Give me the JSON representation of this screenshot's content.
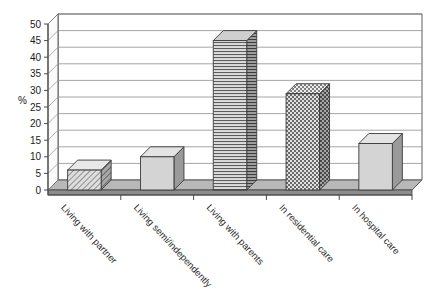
{
  "chart_data": {
    "type": "bar",
    "title": "",
    "subtitle": "",
    "xlabel": "",
    "ylabel": "%",
    "ylim": [
      0,
      50
    ],
    "ytick_step": 5,
    "yticks": [
      "0",
      "5",
      "10",
      "15",
      "20",
      "25",
      "30",
      "35",
      "40",
      "45",
      "50"
    ],
    "grid": true,
    "grid_axis": "y",
    "legend": false,
    "legend_position": "none",
    "style": "3d-column",
    "categories": [
      "Living with partner",
      "Living semi/independently",
      "Living with parents",
      "In residential care",
      "In hospital care"
    ],
    "values": [
      6,
      10,
      45,
      29,
      14
    ],
    "series": [
      {
        "name": "%",
        "values": [
          6,
          10,
          45,
          29,
          14
        ]
      }
    ],
    "bar_patterns": [
      "diagonal-hatch",
      "solid-light-gray",
      "horizontal-lines",
      "checkerboard",
      "solid-light-gray"
    ]
  },
  "colors": {
    "bar_fill": "#d4d4d4",
    "bar_side": "#9a9a9a",
    "bar_top": "#e4e4e4",
    "bar_outline": "#3a3a3a",
    "floor": "#8c8c8c",
    "floor_top": "#b8b8b8",
    "wall": "#ffffff",
    "grid_line": "#8e8e8e",
    "axis_line": "#4a4a4a",
    "text": "#1a1a1a",
    "background": "#ffffff"
  }
}
